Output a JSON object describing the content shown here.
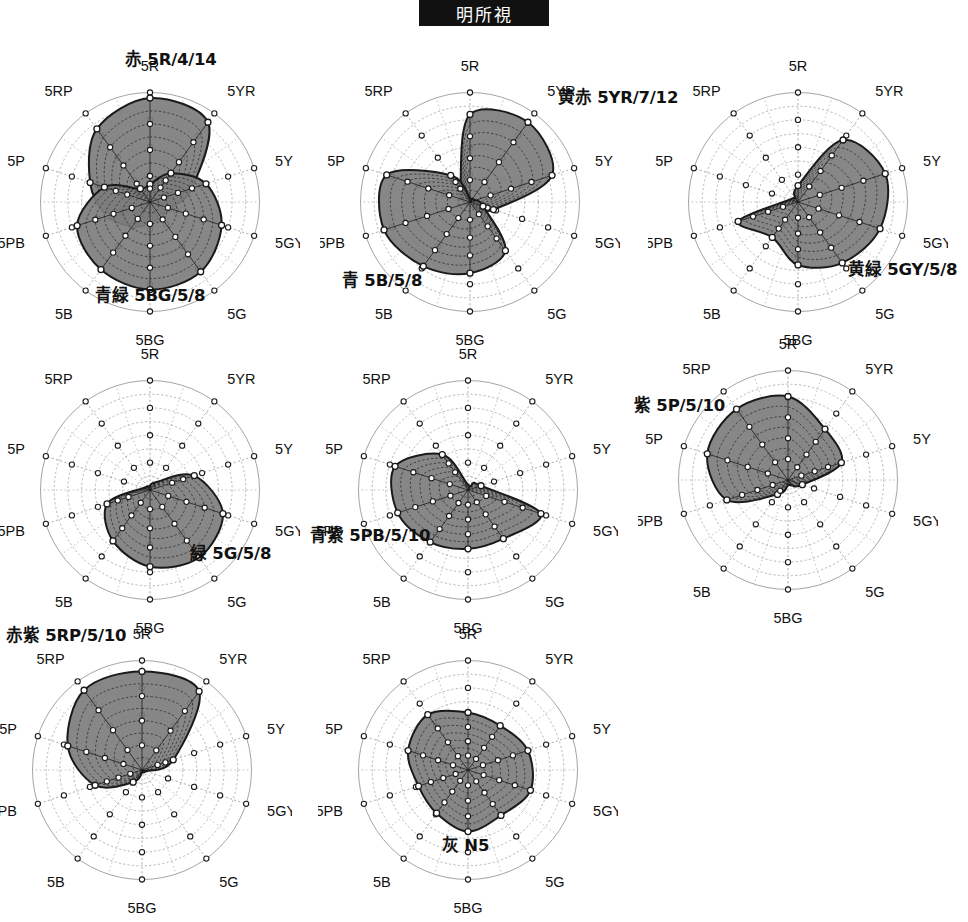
{
  "figure": {
    "banner_title": "明所視",
    "axis_labels": [
      "5R",
      "5YR",
      "5Y",
      "5GY",
      "5G",
      "5BG",
      "5B",
      "5PB",
      "5P",
      "5RP"
    ],
    "colors": {
      "fill": "#7d7d7d",
      "outline": "#1a1a1a",
      "grid": "#9a9a9a",
      "marker_fill": "#ffffff",
      "marker_edge": "#1a1a1a",
      "banner_bg": "#111111",
      "banner_text": "#ffffff"
    },
    "grid": {
      "rings": 8,
      "spokes": 20,
      "marker_rings": [
        2,
        4,
        6,
        8
      ],
      "rmax": 8
    }
  },
  "chart_data": [
    {
      "type": "radar",
      "panel": 1,
      "title": "赤 5R/4/14",
      "title_position": "top-center",
      "categories": [
        "5R",
        "5YR",
        "5Y",
        "5GY",
        "5G",
        "5BG",
        "5B",
        "5PB",
        "5P",
        "5RP"
      ],
      "rlim": [
        0,
        8
      ],
      "grid": true,
      "series": [
        {
          "name": "赤 5R/4/14",
          "label_position": "top-center",
          "values": [
            7.6,
            7.2,
            3.2,
            1.5,
            1.3,
            1.6,
            2.2,
            3.3,
            4.6,
            6.6
          ]
        },
        {
          "name": "青緑 5BG/5/8",
          "label_position": "bottom-center",
          "values": [
            1.3,
            2.6,
            4.3,
            5.5,
            6.3,
            6.4,
            6.1,
            5.6,
            3.5,
            1.2
          ]
        }
      ]
    },
    {
      "type": "radar",
      "panel": 2,
      "title": "黄赤 5YR/7/12",
      "title_position": "right",
      "categories": [
        "5R",
        "5YR",
        "5Y",
        "5GY",
        "5G",
        "5BG",
        "5B",
        "5PB",
        "5P",
        "5RP"
      ],
      "rlim": [
        0,
        8
      ],
      "grid": true,
      "series": [
        {
          "name": "黄赤 5YR/7/12",
          "label_position": "right",
          "values": [
            6.4,
            7.2,
            6.3,
            1.8,
            0.5,
            0.3,
            0.3,
            0.4,
            0.6,
            1.2
          ]
        },
        {
          "name": "青 5B/5/8",
          "label_position": "bottom-left",
          "values": [
            0.3,
            0.3,
            0.4,
            1.0,
            4.4,
            5.2,
            5.8,
            6.6,
            6.4,
            2.4
          ]
        }
      ]
    },
    {
      "type": "radar",
      "panel": 3,
      "title": "黄緑 5GY/5/8",
      "title_position": "bottom-right",
      "categories": [
        "5R",
        "5YR",
        "5Y",
        "5GY",
        "5G",
        "5BG",
        "5B",
        "5PB",
        "5P",
        "5RP"
      ],
      "rlim": [
        0,
        8
      ],
      "grid": true,
      "series": [
        {
          "name": "黄緑 5GY/5/8",
          "label_position": "bottom-right",
          "values": [
            1.2,
            5.6,
            6.7,
            6.3,
            5.5,
            4.6,
            3.2,
            4.6,
            0.6,
            0.4
          ]
        }
      ]
    },
    {
      "type": "radar",
      "panel": 4,
      "title": "緑 5G/5/8",
      "title_position": "bottom-right",
      "categories": [
        "5R",
        "5YR",
        "5Y",
        "5GY",
        "5G",
        "5BG",
        "5B",
        "5PB",
        "5P",
        "5RP"
      ],
      "rlim": [
        0,
        8
      ],
      "grid": true,
      "series": [
        {
          "name": "緑 5G/5/8",
          "label_position": "bottom-right",
          "values": [
            0.3,
            0.7,
            3.4,
            5.6,
            6.1,
            5.6,
            4.6,
            3.3,
            0.5,
            0.3
          ]
        }
      ]
    },
    {
      "type": "radar",
      "panel": 5,
      "title": "青紫 5PB/5/10",
      "title_position": "left",
      "categories": [
        "5R",
        "5YR",
        "5Y",
        "5GY",
        "5G",
        "5BG",
        "5B",
        "5PB",
        "5P",
        "5RP"
      ],
      "rlim": [
        0,
        8
      ],
      "grid": true,
      "series": [
        {
          "name": "青紫 5PB/5/10",
          "label_position": "left",
          "values": [
            0.4,
            0.6,
            1.0,
            5.6,
            4.4,
            4.3,
            4.7,
            5.4,
            5.6,
            3.2
          ]
        }
      ]
    },
    {
      "type": "radar",
      "panel": 6,
      "title": "紫 5P/5/10",
      "title_position": "top-left",
      "categories": [
        "5R",
        "5YR",
        "5Y",
        "5GY",
        "5G",
        "5BG",
        "5B",
        "5PB",
        "5P",
        "5RP"
      ],
      "rlim": [
        0,
        8
      ],
      "grid": true,
      "series": [
        {
          "name": "紫 5P/5/10",
          "label_position": "top-left",
          "values": [
            6.1,
            4.6,
            4.1,
            1.1,
            0.5,
            0.4,
            1.3,
            4.7,
            6.2,
            6.4
          ]
        }
      ]
    },
    {
      "type": "radar",
      "panel": 7,
      "title": "赤紫 5RP/5/10",
      "title_position": "top-left",
      "categories": [
        "5R",
        "5YR",
        "5Y",
        "5GY",
        "5G",
        "5BG",
        "5B",
        "5PB",
        "5P",
        "5RP"
      ],
      "rlim": [
        0,
        8
      ],
      "grid": true,
      "series": [
        {
          "name": "赤紫 5RP/5/10",
          "label_position": "top-left",
          "values": [
            7.2,
            7.1,
            2.4,
            0.3,
            0.2,
            0.2,
            1.1,
            3.6,
            5.7,
            7.2
          ]
        }
      ]
    },
    {
      "type": "radar",
      "panel": 8,
      "title": "灰 N5",
      "title_position": "bottom-center",
      "categories": [
        "5R",
        "5YR",
        "5Y",
        "5GY",
        "5G",
        "5BG",
        "5B",
        "5PB",
        "5P",
        "5RP"
      ],
      "rlim": [
        0,
        8
      ],
      "grid": true,
      "series": [
        {
          "name": "灰 N5",
          "label_position": "bottom-center",
          "values": [
            4.2,
            4.0,
            4.6,
            4.8,
            4.1,
            4.5,
            3.9,
            3.8,
            4.6,
            5.0
          ]
        }
      ]
    }
  ],
  "panels": [
    {
      "id": 1,
      "left": 0,
      "top": 52,
      "size": 300,
      "caption_offsets": [
        [
          125,
          -6
        ],
        [
          95,
          230
        ]
      ]
    },
    {
      "id": 2,
      "left": 320,
      "top": 52,
      "size": 300,
      "caption_offsets": [
        [
          238,
          32
        ],
        [
          22,
          215
        ]
      ]
    },
    {
      "id": 3,
      "left": 648,
      "top": 52,
      "size": 300,
      "caption_offsets": [
        [
          200,
          204
        ]
      ]
    },
    {
      "id": 4,
      "left": 0,
      "top": 340,
      "size": 300,
      "caption_offsets": [
        [
          190,
          200
        ]
      ]
    },
    {
      "id": 5,
      "left": 318,
      "top": 340,
      "size": 300,
      "caption_offsets": [
        [
          -8,
          182
        ]
      ]
    },
    {
      "id": 6,
      "left": 638,
      "top": 330,
      "size": 300,
      "caption_offsets": [
        [
          -4,
          62
        ]
      ]
    },
    {
      "id": 7,
      "left": -8,
      "top": 620,
      "size": 300,
      "caption_offsets": [
        [
          14,
          2
        ]
      ]
    },
    {
      "id": 8,
      "left": 318,
      "top": 620,
      "size": 300,
      "caption_offsets": [
        [
          124,
          212
        ]
      ]
    }
  ]
}
